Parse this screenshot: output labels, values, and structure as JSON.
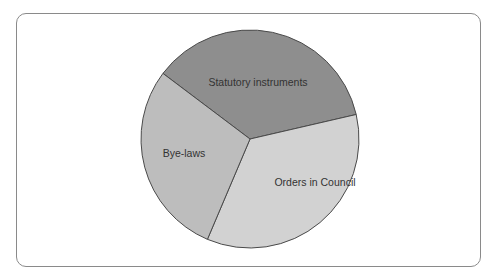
{
  "chart_data": {
    "type": "pie",
    "title": "",
    "slices": [
      {
        "label": "Statutory instruments",
        "value": 36,
        "start_deg": 217,
        "end_deg": 347,
        "color": "#8e8e8e"
      },
      {
        "label": "Orders in Council",
        "value": 36,
        "start_deg": 347,
        "end_deg": 473,
        "color": "#d2d2d2"
      },
      {
        "label": "Bye-laws",
        "value": 28,
        "start_deg": 113,
        "end_deg": 217,
        "color": "#bdbdbd"
      }
    ],
    "center": [
      250,
      139
    ],
    "radius": 109,
    "stroke": "#4a4a4a"
  },
  "labels": {
    "statutory": "Statutory instruments",
    "orders": "Orders in Council",
    "byelaws": "Bye-laws"
  }
}
